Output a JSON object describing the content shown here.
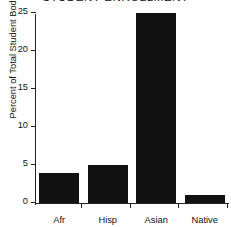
{
  "chart_data": {
    "type": "bar",
    "title": "STUDENT ENROLLMENT",
    "xlabel": "",
    "ylabel": "Percent of Total Student Body",
    "categories": [
      "Afr",
      "Hisp",
      "Asian",
      "Native"
    ],
    "values": [
      4,
      5,
      25,
      1
    ],
    "ylim": [
      0,
      25
    ],
    "yticks": [
      0,
      5,
      10,
      15,
      20,
      25
    ],
    "ytick_labels": [
      "0",
      "5",
      "10",
      "15",
      "20",
      "25"
    ],
    "grid": false,
    "legend": "none",
    "bar_color": "#111111",
    "axis_color": "#222222",
    "background": "#ffffff"
  }
}
